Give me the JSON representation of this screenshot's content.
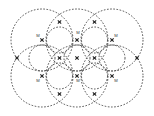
{
  "figure": {
    "title": "Close-packed overlapping sphere lattice diagram",
    "type": "crystal-structure-packing-diagram",
    "canvas": {
      "width": 154,
      "height": 116,
      "background": "#ffffff"
    },
    "style": {
      "circle_stroke": "#3b3b3b",
      "circle_stroke_width": 0.9,
      "circle_dash": "1.6 1.6",
      "node_color": "#2a2a2a",
      "label_color": "#3a3a3a"
    },
    "large_circles": {
      "radius": 31,
      "label": "large anion sphere",
      "centers": [
        {
          "cx": 42,
          "cy": 40
        },
        {
          "cx": 77,
          "cy": 40
        },
        {
          "cx": 112,
          "cy": 40
        },
        {
          "cx": 42,
          "cy": 76
        },
        {
          "cx": 77,
          "cy": 76
        },
        {
          "cx": 112,
          "cy": 76
        }
      ]
    },
    "small_circles": {
      "radius": 13,
      "label": "small cation sphere",
      "centers": [
        {
          "cx": 59.5,
          "cy": 40
        },
        {
          "cx": 94.5,
          "cy": 40
        },
        {
          "cx": 42,
          "cy": 58
        },
        {
          "cx": 77,
          "cy": 58
        },
        {
          "cx": 112,
          "cy": 58
        },
        {
          "cx": 59.5,
          "cy": 76
        },
        {
          "cx": 94.5,
          "cy": 76
        }
      ]
    },
    "nodes": {
      "label": "lattice intersection node",
      "size": 3.4,
      "points": [
        {
          "cx": 59.5,
          "cy": 58
        },
        {
          "cx": 77,
          "cy": 40
        },
        {
          "cx": 94.5,
          "cy": 58
        },
        {
          "cx": 77,
          "cy": 58
        },
        {
          "cx": 77,
          "cy": 76
        },
        {
          "cx": 59.5,
          "cy": 22
        },
        {
          "cx": 94.5,
          "cy": 22
        },
        {
          "cx": 59.5,
          "cy": 94
        },
        {
          "cx": 94.5,
          "cy": 94
        },
        {
          "cx": 42,
          "cy": 40
        },
        {
          "cx": 112,
          "cy": 40
        },
        {
          "cx": 42,
          "cy": 76
        },
        {
          "cx": 112,
          "cy": 76
        },
        {
          "cx": 17,
          "cy": 58
        },
        {
          "cx": 137,
          "cy": 58
        }
      ]
    },
    "ion_labels": [
      {
        "text": "M",
        "x": 38,
        "y": 36
      },
      {
        "text": "M",
        "x": 78,
        "y": 33
      },
      {
        "text": "M",
        "x": 116,
        "y": 36
      },
      {
        "text": "M",
        "x": 38,
        "y": 81
      },
      {
        "text": "M",
        "x": 78,
        "y": 81
      },
      {
        "text": "M",
        "x": 116,
        "y": 81
      }
    ]
  }
}
